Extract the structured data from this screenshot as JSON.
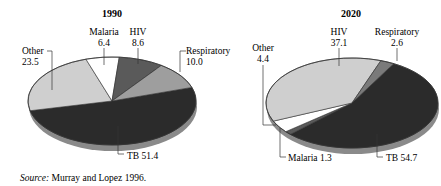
{
  "chart_data": [
    {
      "type": "pie",
      "title": "1990",
      "categories": [
        "TB",
        "Other",
        "Malaria",
        "HIV",
        "Respiratory"
      ],
      "values": [
        51.4,
        23.5,
        6.4,
        8.6,
        10.0
      ],
      "colors": [
        "#2b2b2b",
        "#cfcfcf",
        "#ffffff",
        "#5a5a5a",
        "#9e9e9e"
      ],
      "start_angle_deg": -18,
      "geometry": {
        "cx": 112,
        "cy": 101,
        "rx": 84,
        "ry": 44,
        "depth": 6
      },
      "labels": [
        {
          "category": "TB",
          "text": "TB 51.4",
          "lines": [
            "TB 51.4"
          ],
          "x": 127,
          "y": 159,
          "anchor": "start",
          "leader": [
            [
              118,
              126
            ],
            [
              118,
              154
            ],
            [
              124,
              154
            ]
          ]
        },
        {
          "category": "Other",
          "text": "Other 23.5",
          "lines": [
            "Other",
            "23.5"
          ],
          "x": 22,
          "y": 54,
          "anchor": "start",
          "leader": [
            [
              47,
              51
            ],
            [
              52,
              51
            ],
            [
              52,
              90
            ]
          ]
        },
        {
          "category": "Malaria",
          "text": "Malaria 6.4",
          "lines": [
            "Malaria",
            "6.4"
          ],
          "x": 104,
          "y": 35,
          "anchor": "middle",
          "leader": [
            [
              104,
              48
            ],
            [
              104,
              65
            ]
          ]
        },
        {
          "category": "HIV",
          "text": "HIV 8.6",
          "lines": [
            "HIV",
            "8.6"
          ],
          "x": 138,
          "y": 35,
          "anchor": "middle",
          "leader": [
            [
              138,
              48
            ],
            [
              138,
              64
            ]
          ]
        },
        {
          "category": "Respiratory",
          "text": "Respiratory 10.0",
          "lines": [
            "Respiratory",
            "10.0"
          ],
          "x": 186,
          "y": 54,
          "anchor": "start",
          "leader": [
            [
              186,
              51
            ],
            [
              180,
              51
            ],
            [
              180,
              72
            ]
          ]
        }
      ]
    },
    {
      "type": "pie",
      "title": "2020",
      "categories": [
        "TB",
        "Malaria",
        "Other",
        "HIV",
        "Respiratory"
      ],
      "values": [
        54.7,
        1.3,
        4.4,
        37.1,
        2.6
      ],
      "colors": [
        "#2b2b2b",
        "#5a5a5a",
        "#ffffff",
        "#cfcfcf",
        "#7a7a7a"
      ],
      "start_angle_deg": -61,
      "geometry": {
        "cx": 352,
        "cy": 103,
        "rx": 86,
        "ry": 45,
        "depth": 6
      },
      "labels": [
        {
          "category": "TB",
          "text": "TB 54.7",
          "lines": [
            "TB 54.7"
          ],
          "x": 386,
          "y": 161,
          "anchor": "start",
          "leader": [
            [
              377,
              134
            ],
            [
              377,
              157
            ],
            [
              383,
              157
            ]
          ]
        },
        {
          "category": "Malaria",
          "text": "Malaria 1.3",
          "lines": [
            "Malaria 1.3"
          ],
          "x": 288,
          "y": 161,
          "anchor": "start",
          "leader": [
            [
              280,
              128
            ],
            [
              280,
              157
            ],
            [
              286,
              157
            ]
          ]
        },
        {
          "category": "Other",
          "text": "Other 4.4",
          "lines": [
            "Other",
            "4.4"
          ],
          "x": 263,
          "y": 51,
          "anchor": "middle",
          "leader": [
            [
              263,
              65
            ],
            [
              263,
              125
            ],
            [
              276,
              125
            ]
          ]
        },
        {
          "category": "HIV",
          "text": "HIV 37.1",
          "lines": [
            "HIV",
            "37.1"
          ],
          "x": 339,
          "y": 35,
          "anchor": "middle",
          "leader": [
            [
              339,
              48
            ],
            [
              339,
              66
            ]
          ]
        },
        {
          "category": "Respiratory",
          "text": "Respiratory 2.6",
          "lines": [
            "Respiratory",
            "2.6"
          ],
          "x": 397,
          "y": 35,
          "anchor": "middle",
          "leader": [
            [
              397,
              48
            ],
            [
              397,
              61
            ]
          ]
        }
      ]
    }
  ],
  "titles": {
    "left": "1990",
    "right": "2020"
  },
  "source": {
    "label": "Source:",
    "text": " Murray and Lopez 1996."
  }
}
